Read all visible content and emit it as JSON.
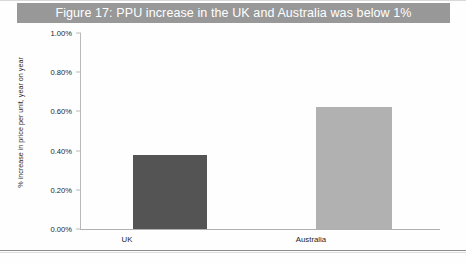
{
  "figure": {
    "title": "Figure 17: PPU increase in the UK and Australia was below 1%",
    "title_band_color": "#989898",
    "title_text_color": "#ffffff",
    "background_color": "#fefefe"
  },
  "chart_data": {
    "type": "bar",
    "title": "Figure 17: PPU increase in the UK and Australia was below 1%",
    "categories": [
      "UK",
      "Australia"
    ],
    "values": [
      0.38,
      0.62
    ],
    "value_unit": "percent",
    "xlabel": "",
    "ylabel": "% increase in price per unit, year on year",
    "ylim": [
      0.0,
      1.0
    ],
    "ytick_values": [
      0.0,
      0.2,
      0.4,
      0.6,
      0.8,
      1.0
    ],
    "ytick_labels": [
      "0.00%",
      "0.20%",
      "0.40%",
      "0.60%",
      "0.80%",
      "1.00%"
    ],
    "grid": false,
    "legend": false,
    "legend_position": "none",
    "bar_colors": [
      "#545454",
      "#b1b1b1"
    ],
    "series": [
      {
        "name": "PPU increase",
        "points": [
          {
            "category": "UK",
            "value": 0.38,
            "label": "0.38%",
            "color": "#545454"
          },
          {
            "category": "Australia",
            "value": 0.62,
            "label": "0.62%",
            "color": "#b1b1b1"
          }
        ]
      }
    ]
  },
  "axis": {
    "y_title": "% increase in price per unit, year on year",
    "ticks": [
      {
        "label": "1.00%",
        "value": 1.0
      },
      {
        "label": "0.80%",
        "value": 0.8
      },
      {
        "label": "0.60%",
        "value": 0.6
      },
      {
        "label": "0.40%",
        "value": 0.4
      },
      {
        "label": "0.20%",
        "value": 0.2
      },
      {
        "label": "0.00%",
        "value": 0.0
      }
    ]
  },
  "categories": [
    {
      "label": "UK"
    },
    {
      "label": "Australia"
    }
  ]
}
